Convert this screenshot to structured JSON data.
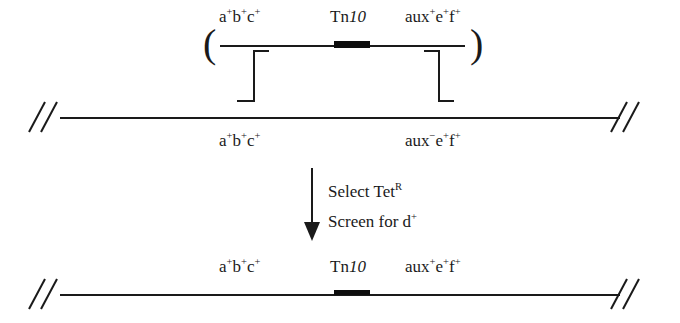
{
  "diagram": {
    "donor_fragment": {
      "open_paren": "(",
      "close_paren": ")",
      "labels": {
        "left_markers": "a+b+c+",
        "left_markers_base": "a",
        "transposon_prefix": "Tn",
        "transposon_number": "10",
        "right_markers": "aux+e+f+"
      }
    },
    "recipient_chromosome": {
      "left_markers": "a+b+c+",
      "right_markers": "aux−e+f+"
    },
    "selection_step": {
      "line1_prefix": "Select Tet",
      "line1_sup": "R",
      "line2_prefix": "Screen for d",
      "line2_sup": "+"
    },
    "recombinant_chromosome": {
      "left_markers": "a+b+c+",
      "transposon_prefix": "Tn",
      "transposon_number": "10",
      "right_markers": "aux+e+f+"
    },
    "icons": {
      "break_left": "chromosome-break-icon",
      "break_right": "chromosome-break-icon",
      "arrow": "down-arrow-icon",
      "transposon": "transposon-block-icon",
      "crossover_left": "crossover-bracket-icon",
      "crossover_right": "crossover-bracket-icon"
    },
    "colors": {
      "ink": "#1a1a1a",
      "background": "#ffffff",
      "transposon": "#0d0d0d"
    }
  }
}
